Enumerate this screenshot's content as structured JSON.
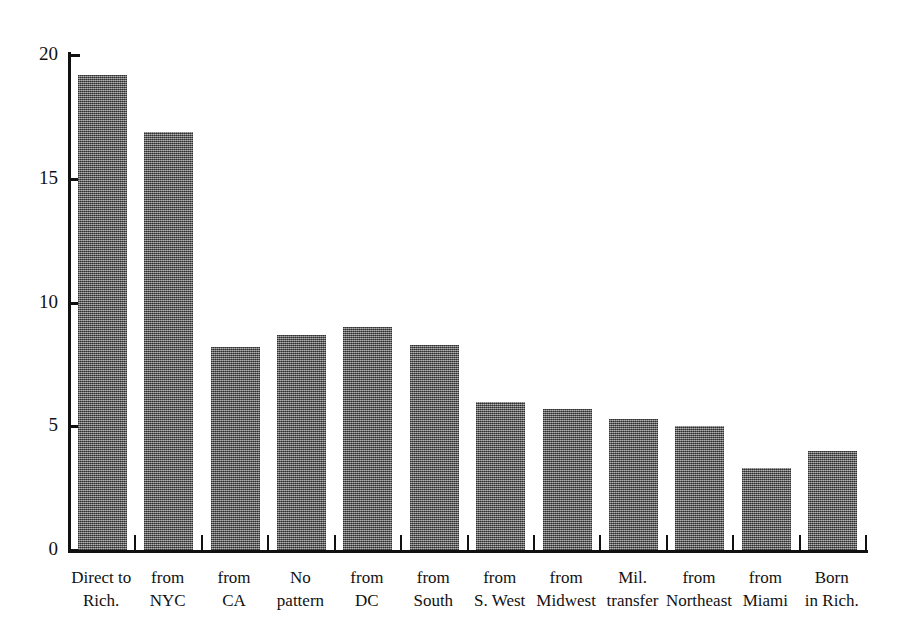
{
  "chart_data": {
    "type": "bar",
    "title": "",
    "subtitle": "",
    "xlabel": "",
    "ylabel": "",
    "ylim": [
      0,
      20
    ],
    "yticks": [
      0,
      5,
      10,
      15,
      20
    ],
    "ytick_labels": [
      "0",
      "5",
      "10",
      "15",
      "20"
    ],
    "grid": false,
    "legend": "none",
    "bar_color": "#6f6f6f",
    "axis_color": "#111111",
    "categories": [
      "Direct to\nRich.",
      "from\nNYC",
      "from\nCA",
      "No\npattern",
      "from\nDC",
      "from\nSouth",
      "from\nS. West",
      "from\nMidwest",
      "Mil.\ntransfer",
      "from\nNortheast",
      "from\nMiami",
      "Born\nin Rich."
    ],
    "values": [
      19.2,
      16.9,
      8.2,
      8.7,
      9.0,
      8.3,
      6.0,
      5.7,
      5.3,
      5.0,
      3.3,
      4.0
    ]
  }
}
